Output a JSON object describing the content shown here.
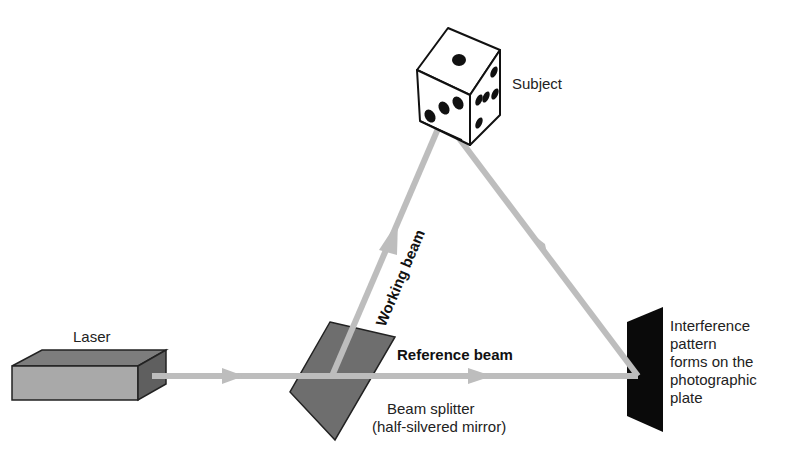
{
  "diagram": {
    "labels": {
      "laser": "Laser",
      "subject": "Subject",
      "working_beam": "Working beam",
      "reference_beam": "Reference beam",
      "beam_splitter_line1": "Beam splitter",
      "beam_splitter_line2": "(half-silvered mirror)",
      "plate_line1": "Interference",
      "plate_line2": "pattern",
      "plate_line3": "forms on the",
      "plate_line4": "photographic",
      "plate_line5": "plate"
    },
    "components": [
      {
        "name": "Laser",
        "shape": "box",
        "color": "#a9a9a9"
      },
      {
        "name": "Beam splitter",
        "shape": "parallelogram",
        "color": "#6e6e6e"
      },
      {
        "name": "Subject",
        "shape": "die",
        "faces": {
          "top": 1,
          "left": 3,
          "right": 6
        }
      },
      {
        "name": "Photographic plate",
        "shape": "plate",
        "color": "#0a0a0a"
      }
    ],
    "beams": [
      {
        "from": "Laser",
        "to": "Beam splitter",
        "label": ""
      },
      {
        "from": "Beam splitter",
        "to": "Subject",
        "label": "Working beam"
      },
      {
        "from": "Subject",
        "to": "Photographic plate",
        "label": ""
      },
      {
        "from": "Beam splitter",
        "to": "Photographic plate",
        "label": "Reference beam"
      }
    ],
    "colors": {
      "beam": "#bdbdbd",
      "laser_front": "#a9a9a9",
      "laser_top": "#7d7d7d",
      "laser_side": "#5f5f5f",
      "splitter": "#6e6e6e",
      "plate": "#0a0a0a"
    }
  }
}
